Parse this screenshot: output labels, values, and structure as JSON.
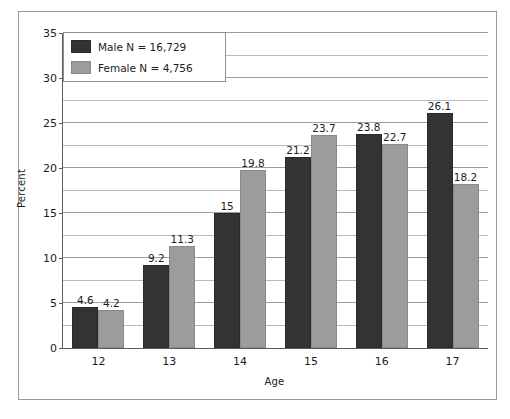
{
  "chart_data": {
    "type": "bar",
    "title": "",
    "xlabel": "Age",
    "ylabel": "Percent",
    "categories": [
      "12",
      "13",
      "14",
      "15",
      "16",
      "17"
    ],
    "series": [
      {
        "name": "Male N = 16,729",
        "color": "#333333",
        "values": [
          4.6,
          9.2,
          15,
          21.2,
          23.8,
          26.1
        ],
        "value_labels": [
          "4.6",
          "9.2",
          "15",
          "21.2",
          "23.8",
          "26.1"
        ]
      },
      {
        "name": "Female N = 4,756",
        "color": "#9c9c9c",
        "values": [
          4.2,
          11.3,
          19.8,
          23.7,
          22.7,
          18.2
        ],
        "value_labels": [
          "4.2",
          "11.3",
          "19.8",
          "23.7",
          "22.7",
          "18.2"
        ]
      }
    ],
    "ylim": [
      0,
      35
    ],
    "ytick_labels": [
      "0",
      "5",
      "10",
      "15",
      "20",
      "25",
      "30",
      "35"
    ],
    "ytick_values": [
      0,
      5,
      10,
      15,
      20,
      25,
      30,
      35
    ],
    "minor_gridline_step": 2.5,
    "grid": "horizontal",
    "legend_position": "top-left"
  },
  "legend": {
    "entries": [
      {
        "label": "Male N = 16,729"
      },
      {
        "label": "Female N = 4,756"
      }
    ]
  },
  "axes": {
    "x_title": "Age",
    "y_title": "Percent"
  }
}
